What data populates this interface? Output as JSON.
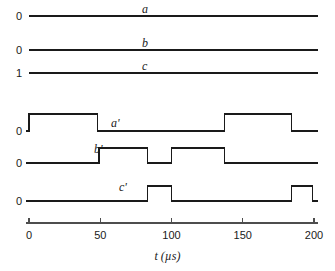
{
  "figure": {
    "background_color": "#ffffff",
    "line_color": "#1a1a1a",
    "axis_color": "#4d4d4d",
    "width": 335,
    "height": 271
  },
  "chart_data": {
    "type": "line",
    "subtype": "digital-timing-waveform",
    "title": "",
    "xlabel": "t (µs)",
    "ylabel": "",
    "xlim": [
      0,
      203
    ],
    "grid": false,
    "legend": "none",
    "x_ticks": [
      0,
      50,
      100,
      150,
      200
    ],
    "x_tick_labels": [
      "0",
      "50",
      "100",
      "150",
      "200"
    ],
    "series": [
      {
        "name": "a",
        "label": "a",
        "y_label": "0",
        "level_type": "constant",
        "constant_value": 0,
        "transitions": [],
        "x_range": [
          0,
          203
        ]
      },
      {
        "name": "b",
        "label": "b",
        "y_label": "0",
        "level_type": "constant",
        "constant_value": 0,
        "transitions": [],
        "x_range": [
          0,
          203
        ]
      },
      {
        "name": "c",
        "label": "c",
        "y_label": "1",
        "level_type": "constant",
        "constant_value": 1,
        "transitions": [],
        "x_range": [
          0,
          203
        ]
      },
      {
        "name": "a_prime",
        "label": "a'",
        "y_label": "0",
        "level_type": "square",
        "start_level": 0,
        "transitions": [
          {
            "t": 0,
            "to": 1
          },
          {
            "t": 48,
            "to": 0
          },
          {
            "t": 137,
            "to": 1
          },
          {
            "t": 184,
            "to": 0
          }
        ],
        "x_range": [
          -2,
          203
        ]
      },
      {
        "name": "b_prime",
        "label": "b'",
        "y_label": "0",
        "level_type": "square",
        "start_level": 0,
        "transitions": [
          {
            "t": 49,
            "to": 1
          },
          {
            "t": 83,
            "to": 0
          },
          {
            "t": 100,
            "to": 1
          },
          {
            "t": 137,
            "to": 0
          }
        ],
        "x_range": [
          -2,
          203
        ]
      },
      {
        "name": "c_prime",
        "label": "c'",
        "y_label": "0",
        "level_type": "square",
        "start_level": 0,
        "transitions": [
          {
            "t": 83,
            "to": 1
          },
          {
            "t": 100,
            "to": 0
          },
          {
            "t": 184,
            "to": 1
          },
          {
            "t": 199,
            "to": 0
          }
        ],
        "x_range": [
          -2,
          203
        ]
      }
    ]
  },
  "layout": {
    "x_origin_px": 29,
    "px_per_us": 1.425,
    "trace_rows": [
      {
        "name": "a",
        "baseline_y": 16,
        "amplitude_px": 0,
        "label_x": 142,
        "label_y": 3,
        "y_label_x": 6,
        "y_label_y": 11
      },
      {
        "name": "b",
        "baseline_y": 50,
        "amplitude_px": 0,
        "label_x": 142,
        "label_y": 37,
        "y_label_x": 6,
        "y_label_y": 45
      },
      {
        "name": "c",
        "baseline_y": 73,
        "amplitude_px": 0,
        "label_x": 142,
        "label_y": 60,
        "y_label_x": 6,
        "y_label_y": 68
      },
      {
        "name": "a_prime",
        "baseline_y": 131,
        "amplitude_px": 17,
        "label_x": 111,
        "label_y": 117,
        "y_label_x": 6,
        "y_label_y": 126
      },
      {
        "name": "b_prime",
        "baseline_y": 163,
        "amplitude_px": 15,
        "label_x": 94,
        "label_y": 143,
        "y_label_x": 6,
        "y_label_y": 158
      },
      {
        "name": "c_prime",
        "baseline_y": 201,
        "amplitude_px": 15,
        "label_x": 119,
        "label_y": 181,
        "y_label_x": 6,
        "y_label_y": 196
      }
    ],
    "axis_y": 223,
    "tick_height": 5,
    "tick_label_y": 230,
    "axis_title_x": 150,
    "axis_title_y": 250
  }
}
